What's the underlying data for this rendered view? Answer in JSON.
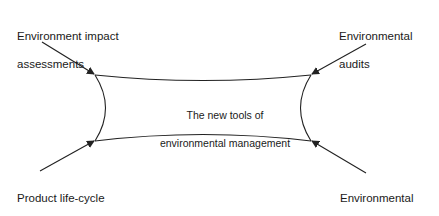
{
  "diagram": {
    "center": {
      "line1": "The new tools of",
      "line2": "environmental management"
    },
    "tools": [
      {
        "position": "top-left",
        "line1": "Environment impact",
        "line2": "assessments"
      },
      {
        "position": "top-right",
        "line1": "Environmental",
        "line2": "audits"
      },
      {
        "position": "bottom-left",
        "line1": "Product life-cycle",
        "line2": "analysis"
      },
      {
        "position": "bottom-right",
        "line1": "Environmental",
        "line2": "accounting"
      }
    ],
    "colors": {
      "line": "#222222",
      "text": "#1a1a1a",
      "background": "#ffffff"
    }
  }
}
